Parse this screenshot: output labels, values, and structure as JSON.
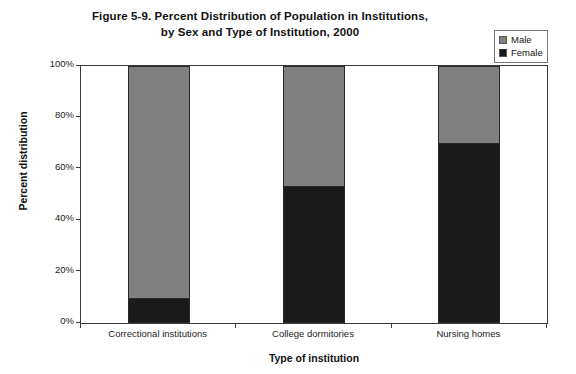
{
  "chart_data": {
    "type": "bar",
    "subtype": "stacked-100-percent",
    "title": "Figure 5-9. Percent Distribution of Population in Institutions, by Sex and Type of Institution, 2000",
    "title_lines": [
      "Figure 5-9. Percent Distribution of Population in Institutions,",
      "by Sex and Type of Institution, 2000"
    ],
    "xlabel": "Type of institution",
    "ylabel": "Percent distribution",
    "categories": [
      "Correctional institutions",
      "College dormitories",
      "Nursing homes"
    ],
    "series": [
      {
        "name": "Female",
        "color": "#1a1a1a",
        "values": [
          9,
          53,
          70
        ]
      },
      {
        "name": "Male",
        "color": "#808080",
        "values": [
          91,
          47,
          30
        ]
      }
    ],
    "ylim": [
      0,
      100
    ],
    "ytick_labels": [
      "0%",
      "20%",
      "40%",
      "60%",
      "80%",
      "100%"
    ],
    "ytick_values": [
      0,
      20,
      40,
      60,
      80,
      100
    ],
    "grid": false,
    "legend_position": "top-right",
    "legend_entries": [
      "Male",
      "Female"
    ]
  },
  "colors": {
    "male": "#808080",
    "female": "#1a1a1a",
    "axis": "#3a3a3a",
    "background": "#ffffff",
    "text": "#121212"
  }
}
